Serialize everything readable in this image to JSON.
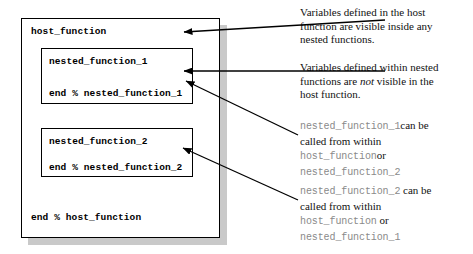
{
  "diagram": {
    "host": {
      "header": "host_function",
      "footer": "end % host_function"
    },
    "nested": [
      {
        "header": "nested_function_1",
        "footer": "end % nested_function_1"
      },
      {
        "header": "nested_function_2",
        "footer": "end % nested_function_2"
      }
    ]
  },
  "annotations": [
    {
      "id": "host-scope-note",
      "text": "Variables defined in the host function are visible inside any nested functions.",
      "line1": "Variables defined in the host",
      "line2": "function are visible inside any",
      "line3": "nested functions."
    },
    {
      "id": "nested-scope-note",
      "line1": "Variables defined within nested",
      "line2_before": "functions are ",
      "line2_emphasis": "not",
      "line2_after": " visible in the",
      "line3": "host function."
    },
    {
      "id": "nested1-call-note",
      "line1_code": "nested_function_1",
      "line1_text": "can be",
      "line2_text": "called from within",
      "line3_code": "host_function",
      "line3_text": "or",
      "line4_code": "nested_function_2"
    },
    {
      "id": "nested2-call-note",
      "line1_code": "nested_function_2",
      "line1_text": " can be",
      "line2_text": "called from within",
      "line3_code": "host_function",
      "line3_text": " or",
      "line4_code": "nested_function_1"
    }
  ],
  "colors": {
    "box_border": "#000000",
    "box_fill": "#ffffff",
    "shadow": "#c9c9c9",
    "code_text": "#000000",
    "annotation_text": "#111111",
    "annotation_mono": "#8a8a8a",
    "arrow": "#000000"
  },
  "arrows": [
    {
      "name": "arrow-to-host-box",
      "from_x": 385,
      "from_y": 20,
      "to_x": 184,
      "to_y": 32
    },
    {
      "name": "arrow-to-nested-1",
      "from_x": 385,
      "from_y": 71,
      "to_x": 184,
      "to_y": 71
    },
    {
      "name": "arrow-to-nested-1-call",
      "from_x": 298,
      "from_y": 135,
      "to_x": 186,
      "to_y": 81
    },
    {
      "name": "arrow-to-nested-2-call",
      "from_x": 298,
      "from_y": 200,
      "to_x": 183,
      "to_y": 148
    }
  ]
}
